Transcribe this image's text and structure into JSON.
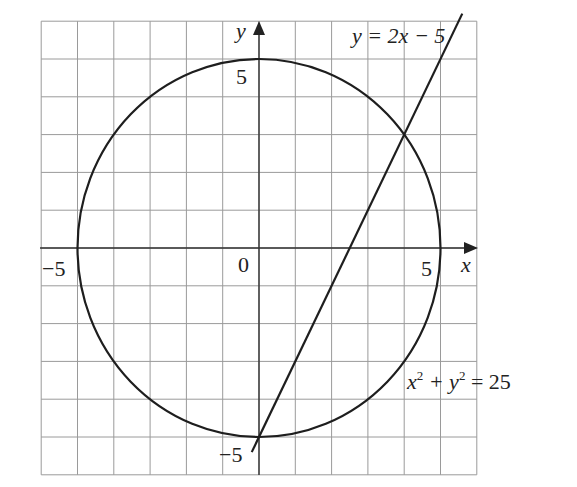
{
  "diagram": {
    "type": "coordinate-graph",
    "grid": {
      "x_min": -6,
      "x_max": 6,
      "y_min": -6,
      "y_max": 6,
      "step": 1
    },
    "axes": {
      "x_label": "x",
      "y_label": "y",
      "origin_label": "0",
      "tick_labels": {
        "x_neg": "−5",
        "x_pos": "5",
        "y_pos": "5",
        "y_neg": "−5"
      }
    },
    "curves": [
      {
        "name": "circle",
        "equation_lhs": "x",
        "sup1": "2",
        "plus": " + y",
        "sup2": "2",
        "rhs": " = 25",
        "center": [
          0,
          0
        ],
        "radius": 5
      },
      {
        "name": "line",
        "equation": "y = 2x − 5",
        "slope": 2,
        "intercept": -5,
        "x_range": [
          -0.2,
          5.6
        ]
      }
    ],
    "intersections": [
      [
        4,
        3
      ],
      [
        0,
        -5
      ]
    ],
    "colors": {
      "grid": "#9a9a9a",
      "curve": "#1e1e1e",
      "text": "#222222"
    }
  }
}
